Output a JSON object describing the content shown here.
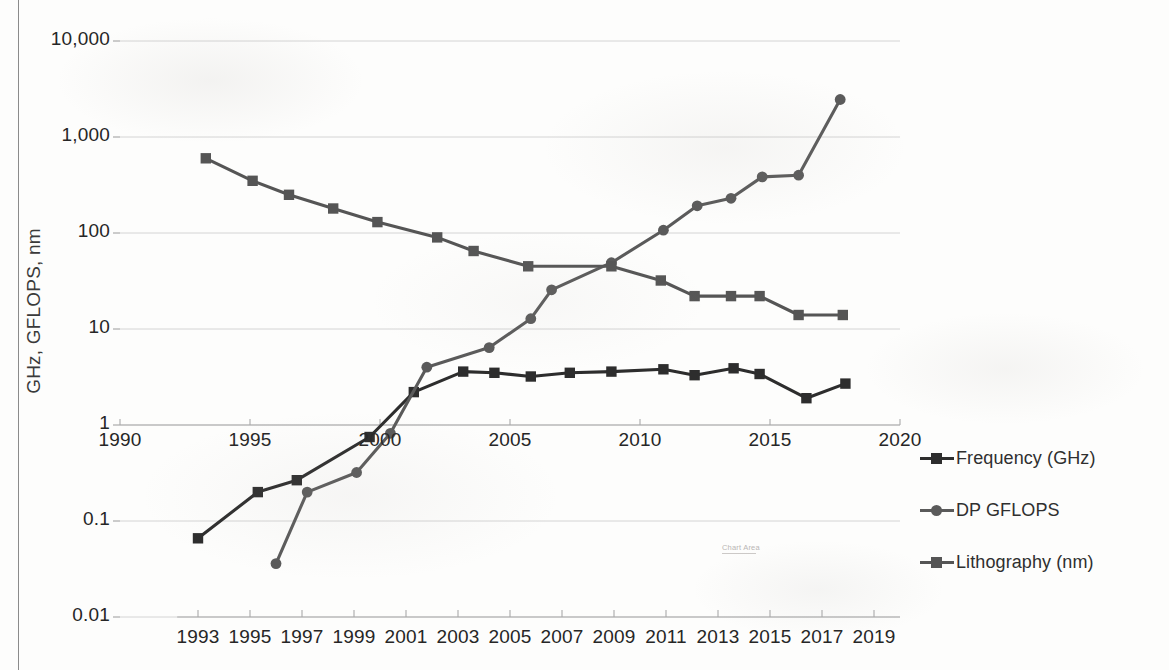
{
  "chart_data": {
    "type": "line",
    "title": "",
    "xlabel": "",
    "ylabel": "GHz, GFLOPS, nm",
    "log_y": true,
    "ylim": [
      0.01,
      10000
    ],
    "ytick_labels": [
      "10,000",
      "1,000",
      "100",
      "10",
      "1",
      "0.1",
      "0.01"
    ],
    "ytick_values": [
      10000,
      1000,
      100,
      10,
      1,
      0.1,
      0.01
    ],
    "grid": true,
    "legend_position": "right",
    "secondary_xaxis": {
      "position": "at y = 1",
      "xlim": [
        1990,
        2020
      ],
      "tick_labels": [
        "1990",
        "1995",
        "2000",
        "2005",
        "2010",
        "2015",
        "2020"
      ],
      "tick_values": [
        1990,
        1995,
        2000,
        2005,
        2010,
        2015,
        2020
      ]
    },
    "primary_xaxis": {
      "position": "bottom",
      "xlim": [
        1992,
        2020
      ],
      "tick_labels": [
        "1993",
        "1995",
        "1997",
        "1999",
        "2001",
        "2003",
        "2005",
        "2007",
        "2009",
        "2011",
        "2013",
        "2015",
        "2017",
        "2019"
      ],
      "tick_values": [
        1993,
        1995,
        1997,
        1999,
        2001,
        2003,
        2005,
        2007,
        2009,
        2011,
        2013,
        2015,
        2017,
        2019
      ]
    },
    "series": [
      {
        "name": "Frequency (GHz)",
        "marker": "square",
        "color": "#2d2d2d",
        "points": [
          [
            1993,
            0.066
          ],
          [
            1995.3,
            0.2
          ],
          [
            1996.8,
            0.266
          ],
          [
            1999.6,
            0.75
          ],
          [
            2001.3,
            2.2
          ],
          [
            2003.2,
            3.6
          ],
          [
            2004.4,
            3.5
          ],
          [
            2005.8,
            3.2
          ],
          [
            2007.3,
            3.5
          ],
          [
            2008.9,
            3.6
          ],
          [
            2010.9,
            3.8
          ],
          [
            2012.1,
            3.3
          ],
          [
            2013.6,
            3.9
          ],
          [
            2014.6,
            3.4
          ],
          [
            2016.4,
            1.9
          ],
          [
            2017.9,
            2.7
          ]
        ]
      },
      {
        "name": "DP GFLOPS",
        "marker": "circle",
        "color": "#5a5a5a",
        "points": [
          [
            1996,
            0.036
          ],
          [
            1997.2,
            0.2
          ],
          [
            1999.1,
            0.32
          ],
          [
            2000.4,
            0.82
          ],
          [
            2001.8,
            4.0
          ],
          [
            2004.2,
            6.4
          ],
          [
            2005.8,
            12.8
          ],
          [
            2006.6,
            25.6
          ],
          [
            2008.9,
            49
          ],
          [
            2010.9,
            107
          ],
          [
            2012.2,
            192
          ],
          [
            2013.5,
            230
          ],
          [
            2014.7,
            384
          ],
          [
            2016.1,
            400
          ],
          [
            2017.7,
            2458
          ]
        ]
      },
      {
        "name": "Lithography (nm)",
        "marker": "square",
        "color": "#555555",
        "points": [
          [
            1993.3,
            600
          ],
          [
            1995.1,
            350
          ],
          [
            1996.5,
            250
          ],
          [
            1998.2,
            180
          ],
          [
            1999.9,
            130
          ],
          [
            2002.2,
            90
          ],
          [
            2003.6,
            65
          ],
          [
            2005.7,
            45
          ],
          [
            2008.9,
            45
          ],
          [
            2010.8,
            32
          ],
          [
            2012.1,
            22
          ],
          [
            2013.5,
            22
          ],
          [
            2014.6,
            22
          ],
          [
            2016.1,
            14
          ],
          [
            2017.8,
            14
          ]
        ]
      }
    ]
  },
  "tooltip": {
    "label": "Chart Area"
  },
  "legend": {
    "items": [
      {
        "label": "Frequency (GHz)",
        "marker": "square",
        "color": "#2d2d2d"
      },
      {
        "label": "DP GFLOPS",
        "marker": "circle",
        "color": "#5a5a5a"
      },
      {
        "label": "Lithography (nm)",
        "marker": "square",
        "color": "#555555"
      }
    ]
  }
}
